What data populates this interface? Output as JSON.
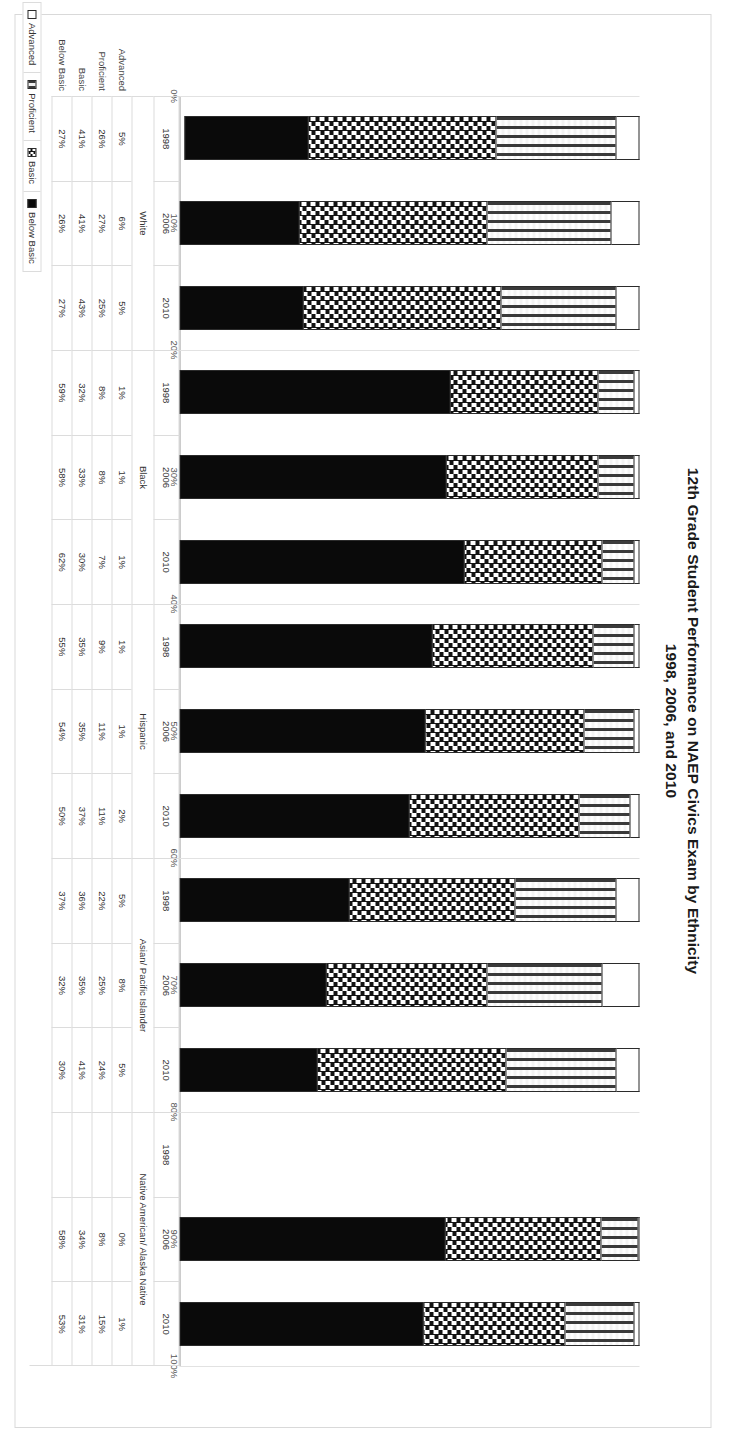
{
  "chart_data": {
    "type": "bar",
    "stacked": true,
    "orientation": "horizontal",
    "normalized_percent": true,
    "title": "12th Grade Student Performance on NAEP Civics Exam by Ethnicity",
    "subtitle": "1998, 2006, and 2010",
    "xlabel": "",
    "ylabel": "",
    "xlim": [
      0,
      100
    ],
    "xtick_labels": [
      "0%",
      "10%",
      "20%",
      "30%",
      "40%",
      "50%",
      "60%",
      "70%",
      "80%",
      "90%",
      "100%"
    ],
    "xtick_values": [
      0,
      10,
      20,
      30,
      40,
      50,
      60,
      70,
      80,
      90,
      100
    ],
    "grid": true,
    "legend_position": "bottom-left",
    "series_order": [
      "Advanced",
      "Proficient",
      "Basic",
      "Below Basic"
    ],
    "legend": [
      {
        "label": "Advanced",
        "pattern": "white"
      },
      {
        "label": "Proficient",
        "pattern": "light-dotted"
      },
      {
        "label": "Basic",
        "pattern": "checkered"
      },
      {
        "label": "Below Basic",
        "pattern": "solid-black"
      }
    ],
    "groups": [
      {
        "name": "White",
        "years": [
          "1998",
          "2006",
          "2010"
        ]
      },
      {
        "name": "Black",
        "years": [
          "1998",
          "2006",
          "2010"
        ]
      },
      {
        "name": "Hispanic",
        "years": [
          "1998",
          "2006",
          "2010"
        ]
      },
      {
        "name": "Asian/ Pacific Islander",
        "years": [
          "1998",
          "2006",
          "2010"
        ]
      },
      {
        "name": "Native American/ Alaska Native",
        "years": [
          "1998",
          "2006",
          "2010"
        ]
      }
    ],
    "categories": [
      "White 1998",
      "White 2006",
      "White 2010",
      "Black 1998",
      "Black 2006",
      "Black 2010",
      "Hispanic 1998",
      "Hispanic 2006",
      "Hispanic 2010",
      "Asian/ Pacific Islander 1998",
      "Asian/ Pacific Islander 2006",
      "Asian/ Pacific Islander 2010",
      "Native American/ Alaska Native 1998",
      "Native American/ Alaska Native 2006",
      "Native American/ Alaska Native 2010"
    ],
    "series": [
      {
        "name": "Advanced",
        "values": [
          5,
          6,
          5,
          1,
          1,
          1,
          1,
          1,
          2,
          5,
          8,
          5,
          null,
          0,
          1
        ]
      },
      {
        "name": "Proficient",
        "values": [
          26,
          27,
          25,
          8,
          8,
          7,
          9,
          11,
          11,
          22,
          25,
          24,
          null,
          8,
          15
        ]
      },
      {
        "name": "Basic",
        "values": [
          41,
          41,
          43,
          32,
          33,
          30,
          35,
          35,
          37,
          36,
          35,
          41,
          null,
          34,
          31
        ]
      },
      {
        "name": "Below Basic",
        "values": [
          27,
          26,
          27,
          59,
          58,
          62,
          55,
          54,
          50,
          37,
          32,
          30,
          null,
          58,
          53
        ]
      }
    ],
    "data_table": {
      "row_headers": [
        "Advanced",
        "Proficient",
        "Basic",
        "Below Basic"
      ],
      "columns": [
        {
          "group": "White",
          "year": "1998",
          "cells": [
            "5%",
            "26%",
            "41%",
            "27%"
          ]
        },
        {
          "group": "White",
          "year": "2006",
          "cells": [
            "6%",
            "27%",
            "41%",
            "26%"
          ]
        },
        {
          "group": "White",
          "year": "2010",
          "cells": [
            "5%",
            "25%",
            "43%",
            "27%"
          ]
        },
        {
          "group": "Black",
          "year": "1998",
          "cells": [
            "1%",
            "8%",
            "32%",
            "59%"
          ]
        },
        {
          "group": "Black",
          "year": "2006",
          "cells": [
            "1%",
            "8%",
            "33%",
            "58%"
          ]
        },
        {
          "group": "Black",
          "year": "2010",
          "cells": [
            "1%",
            "7%",
            "30%",
            "62%"
          ]
        },
        {
          "group": "Hispanic",
          "year": "1998",
          "cells": [
            "1%",
            "9%",
            "35%",
            "55%"
          ]
        },
        {
          "group": "Hispanic",
          "year": "2006",
          "cells": [
            "1%",
            "11%",
            "35%",
            "54%"
          ]
        },
        {
          "group": "Hispanic",
          "year": "2010",
          "cells": [
            "2%",
            "11%",
            "37%",
            "50%"
          ]
        },
        {
          "group": "Asian/ Pacific Islander",
          "year": "1998",
          "cells": [
            "5%",
            "22%",
            "36%",
            "37%"
          ]
        },
        {
          "group": "Asian/ Pacific Islander",
          "year": "2006",
          "cells": [
            "8%",
            "25%",
            "35%",
            "32%"
          ]
        },
        {
          "group": "Asian/ Pacific Islander",
          "year": "2010",
          "cells": [
            "5%",
            "24%",
            "41%",
            "30%"
          ]
        },
        {
          "group": "Native American/ Alaska Native",
          "year": "1998",
          "cells": [
            "",
            "",
            "",
            ""
          ]
        },
        {
          "group": "Native American/ Alaska Native",
          "year": "2006",
          "cells": [
            "0%",
            "8%",
            "34%",
            "58%"
          ]
        },
        {
          "group": "Native American/ Alaska Native",
          "year": "2010",
          "cells": [
            "1%",
            "15%",
            "31%",
            "53%"
          ]
        }
      ]
    }
  }
}
